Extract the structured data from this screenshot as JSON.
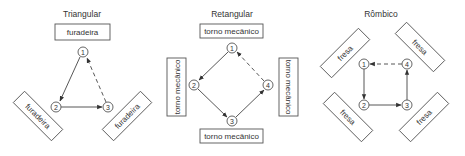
{
  "diagrams": {
    "triangular": {
      "title": "Triangular",
      "machines": [
        "furadeira",
        "furadeira",
        "furadeira"
      ],
      "nodes": [
        "1",
        "2",
        "3"
      ],
      "edges": [
        {
          "from": "1",
          "to": "2",
          "style": "solid"
        },
        {
          "from": "2",
          "to": "3",
          "style": "solid"
        },
        {
          "from": "3",
          "to": "1",
          "style": "dashed"
        }
      ]
    },
    "retangular": {
      "title": "Retangular",
      "machines": [
        "torno mecânico",
        "torno mecânico",
        "torno mecânico",
        "torno mecânico"
      ],
      "nodes": [
        "1",
        "2",
        "3",
        "4"
      ],
      "edges": [
        {
          "from": "1",
          "to": "2",
          "style": "solid"
        },
        {
          "from": "2",
          "to": "3",
          "style": "solid"
        },
        {
          "from": "3",
          "to": "4",
          "style": "solid"
        },
        {
          "from": "4",
          "to": "1",
          "style": "dashed"
        }
      ]
    },
    "rombico": {
      "title": "Rômbico",
      "machines": [
        "fresa",
        "fresa",
        "fresa",
        "fresa"
      ],
      "nodes": [
        "1",
        "2",
        "3",
        "4"
      ],
      "edges": [
        {
          "from": "1",
          "to": "2",
          "style": "solid"
        },
        {
          "from": "2",
          "to": "3",
          "style": "solid"
        },
        {
          "from": "3",
          "to": "4",
          "style": "solid"
        },
        {
          "from": "4",
          "to": "1",
          "style": "dashed"
        }
      ]
    }
  },
  "colors": {
    "stroke": "#555555",
    "text": "#333333",
    "background": "#ffffff"
  }
}
